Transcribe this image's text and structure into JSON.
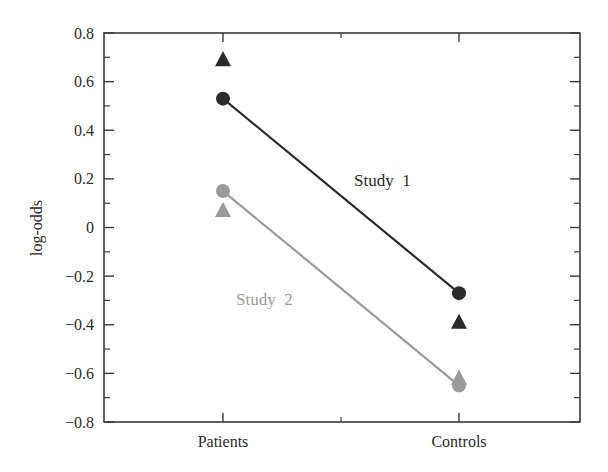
{
  "chart_data": {
    "type": "line",
    "title": "",
    "xlabel": "",
    "ylabel": "log-odds",
    "categories": [
      "Patients",
      "Controls"
    ],
    "ylim": [
      -0.8,
      0.8
    ],
    "yticks": [
      0.8,
      0.6,
      0.4,
      0.2,
      0,
      -0.2,
      -0.4,
      -0.6,
      -0.8
    ],
    "ytick_labels": [
      "0.8",
      "0.6",
      "0.4",
      "0.2",
      "0",
      "−0.2",
      "−0.4",
      "−0.6",
      "−0.8"
    ],
    "grid": false,
    "legend": "none (inline series labels)",
    "series": [
      {
        "name": "Study 1",
        "color": "#2a2a2a",
        "line_values": [
          0.53,
          -0.27
        ],
        "circle_values": [
          0.53,
          -0.27
        ],
        "triangle_values": [
          0.69,
          -0.39
        ],
        "label_position": {
          "x": 354,
          "y": 186
        }
      },
      {
        "name": "Study 2",
        "color": "#9a9a9a",
        "line_values": [
          0.15,
          -0.65
        ],
        "circle_values": [
          0.15,
          -0.65
        ],
        "triangle_values": [
          0.07,
          -0.62
        ],
        "label_position": {
          "x": 236,
          "y": 305
        }
      }
    ],
    "annotations": [
      {
        "text": "Study 1",
        "color": "#2a2a2a"
      },
      {
        "text": "Study 2",
        "color": "#9a9a9a"
      }
    ]
  }
}
